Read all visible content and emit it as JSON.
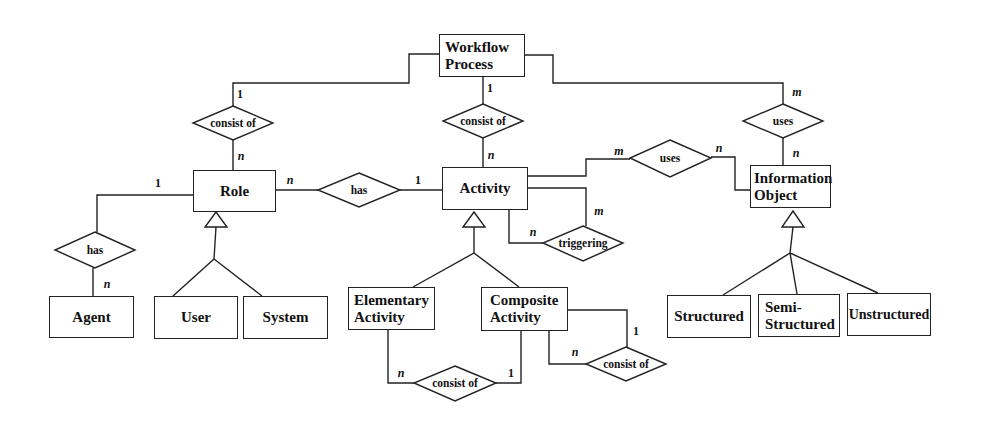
{
  "diagram": {
    "type": "er-diagram",
    "entities": {
      "workflow_process": "Workflow Process",
      "role": "Role",
      "activity": "Activity",
      "information_object": "Information Object",
      "agent": "Agent",
      "user": "User",
      "system": "System",
      "elementary_activity": "Elementary Activity",
      "composite_activity": "Composite Activity",
      "structured": "Structured",
      "semi_structured": "Semi-Structured",
      "unstructured": "Unstructured"
    },
    "relationships": {
      "wp_consist_role": "consist of",
      "wp_consist_activity": "consist of",
      "wp_uses_info": "uses",
      "role_has_activity": "has",
      "agent_has_role": "has",
      "activity_uses_info": "uses",
      "activity_triggering": "triggering",
      "elem_consist_comp": "consist of",
      "comp_consist_self": "consist of"
    },
    "cardinalities": {
      "wp_role_top": "1",
      "wp_role_bottom": "n",
      "wp_activity_top": "1",
      "wp_activity_bottom": "n",
      "wp_info_top": "m",
      "wp_info_bottom": "n",
      "role_has_left": "n",
      "role_has_right": "1",
      "agent_has_top": "1",
      "agent_has_bottom": "n",
      "activity_uses_left": "m",
      "activity_uses_right": "n",
      "triggering_top": "m",
      "triggering_left": "n",
      "elem_consist_left": "n",
      "elem_consist_right": "1",
      "comp_consist_top": "1",
      "comp_consist_left": "n"
    }
  }
}
